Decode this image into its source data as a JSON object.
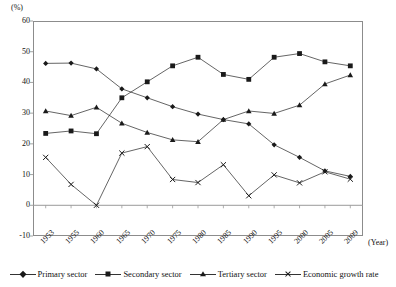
{
  "chart_data": {
    "type": "line",
    "title": "",
    "xlabel": "(Year)",
    "ylabel": "(%)",
    "ylim": [
      -10,
      60
    ],
    "yticks": [
      60,
      50,
      40,
      30,
      20,
      10,
      0,
      -10
    ],
    "grid": false,
    "legend_position": "bottom",
    "categories": [
      "1953",
      "1955",
      "1960",
      "1965",
      "1970",
      "1975",
      "1980",
      "1985",
      "1990",
      "1995",
      "2000",
      "2005",
      "2009"
    ],
    "series": [
      {
        "name": "Primary sector",
        "marker": "diamond",
        "color": "#1a1a1a",
        "values": [
          46.2,
          46.3,
          44.4,
          37.9,
          35.0,
          32.1,
          29.7,
          27.9,
          26.5,
          19.7,
          15.6,
          11.2,
          9.4
        ]
      },
      {
        "name": "Secondary sector",
        "marker": "square",
        "color": "#1a1a1a",
        "values": [
          23.4,
          24.2,
          23.3,
          35.0,
          40.2,
          45.4,
          48.2,
          42.6,
          41.0,
          48.2,
          49.4,
          46.7,
          45.4
        ]
      },
      {
        "name": "Tertiary sector",
        "marker": "triangle",
        "color": "#1a1a1a",
        "values": [
          30.7,
          29.2,
          31.9,
          26.7,
          23.7,
          21.3,
          20.7,
          27.9,
          30.7,
          29.9,
          32.6,
          39.5,
          42.4
        ]
      },
      {
        "name": "Economic growth rate",
        "marker": "cross",
        "color": "#1a1a1a",
        "values": [
          15.6,
          6.8,
          0.0,
          17.0,
          19.1,
          8.4,
          7.4,
          13.2,
          3.1,
          9.9,
          7.3,
          10.9,
          8.5
        ]
      }
    ]
  },
  "axis": {
    "unit_label": "(%)",
    "year_label": "(Year)"
  },
  "legend": {
    "entries": [
      {
        "label": "Primary sector",
        "marker": "diamond"
      },
      {
        "label": "Secondary sector",
        "marker": "square"
      },
      {
        "label": "Tertiary sector",
        "marker": "triangle"
      },
      {
        "label": "Economic growth rate",
        "marker": "cross"
      }
    ]
  }
}
